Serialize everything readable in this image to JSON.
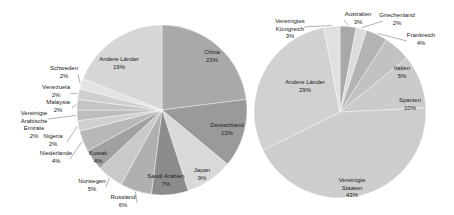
{
  "chart_data": [
    {
      "type": "pie",
      "title": "",
      "center": [
        162,
        110
      ],
      "radius": 85,
      "start_angle_deg": 0,
      "slices": [
        {
          "label": "China",
          "value": 23,
          "color": "#a9a9a9",
          "lx": 212,
          "ly": 54
        },
        {
          "label": "Deutschland",
          "value": 13,
          "color": "#9a9a9a",
          "lx": 227,
          "ly": 127
        },
        {
          "label": "Japan",
          "value": 9,
          "color": "#d9d9d9",
          "lx": 202,
          "ly": 172
        },
        {
          "label": "Saudi Arabien",
          "value": 7,
          "color": "#8c8c8c",
          "lx": 166,
          "ly": 178
        },
        {
          "label": "Russland",
          "value": 6,
          "color": "#b0b0b0",
          "lx": 123,
          "ly": 199,
          "outside": true
        },
        {
          "label": "Norwegen",
          "value": 5,
          "color": "#c9c9c9",
          "lx": 92,
          "ly": 183,
          "outside": true
        },
        {
          "label": "Kuwait",
          "value": 4,
          "color": "#a0a0a0",
          "lx": 98,
          "ly": 155
        },
        {
          "label": "Niederlande",
          "value": 4,
          "color": "#b8b8b8",
          "lx": 56,
          "ly": 155,
          "outside": true
        },
        {
          "label": "Nigeria",
          "value": 2,
          "color": "#d0d0d0",
          "lx": 53,
          "ly": 138,
          "outside": true
        },
        {
          "label": "Vereinigte Arabische Emirate",
          "value": 2,
          "color": "#bdbdbd",
          "lx": 34,
          "ly": 115,
          "outside": true
        },
        {
          "label": "Malaysia",
          "value": 2,
          "color": "#c4c4c4",
          "lx": 58,
          "ly": 104,
          "outside": true
        },
        {
          "label": "Venezuela",
          "value": 2,
          "color": "#cfcfcf",
          "lx": 56,
          "ly": 89,
          "outside": true
        },
        {
          "label": "Schweden",
          "value": 2,
          "color": "#e3e3e3",
          "lx": 64,
          "ly": 70,
          "outside": true
        },
        {
          "label": "Andere Länder",
          "value": 19,
          "color": "#d6d6d6",
          "lx": 119,
          "ly": 61
        }
      ]
    },
    {
      "type": "pie",
      "title": "",
      "center": [
        340,
        112
      ],
      "radius": 86,
      "start_angle_deg": 0,
      "slices": [
        {
          "label": "Australien",
          "value": 3,
          "color": "#a8a8a8",
          "lx": 358,
          "ly": 16,
          "outside": true
        },
        {
          "label": "Griechenland",
          "value": 2,
          "color": "#dcdcdc",
          "lx": 397,
          "ly": 17,
          "outside": true
        },
        {
          "label": "Frankreich",
          "value": 4,
          "color": "#b3b3b3",
          "lx": 421,
          "ly": 37,
          "outside": true
        },
        {
          "label": "Italien",
          "value": 5,
          "color": "#c2c2c2",
          "lx": 402,
          "ly": 70
        },
        {
          "label": "Spanien",
          "value": 10,
          "color": "#cbcbcb",
          "lx": 410,
          "ly": 102
        },
        {
          "label": "Vereinigte Staaten",
          "value": 43,
          "color": "#cdcdcd",
          "lx": 352,
          "ly": 182
        },
        {
          "label": "Andere Länder",
          "value": 29,
          "color": "#d1d1d1",
          "lx": 305,
          "ly": 84
        },
        {
          "label": "Vereinigtes Königreich",
          "value": 3,
          "color": "#e0e0e0",
          "lx": 290,
          "ly": 23,
          "outside": true
        }
      ]
    }
  ]
}
